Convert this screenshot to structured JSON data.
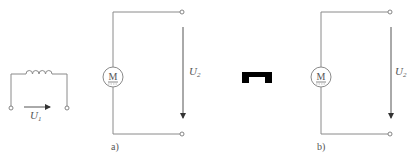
{
  "figure": {
    "inductor_circuit": {
      "voltage_label": "U",
      "voltage_subscript": "1"
    },
    "circuit_a": {
      "motor_letter": "M",
      "voltage_label": "U",
      "voltage_subscript": "2",
      "caption": "a)"
    },
    "blocking_symbol": {
      "description": "black notched block",
      "color": "#000000"
    },
    "circuit_b": {
      "motor_letter": "M",
      "voltage_label": "U",
      "voltage_subscript": "2",
      "caption": "b)"
    }
  }
}
